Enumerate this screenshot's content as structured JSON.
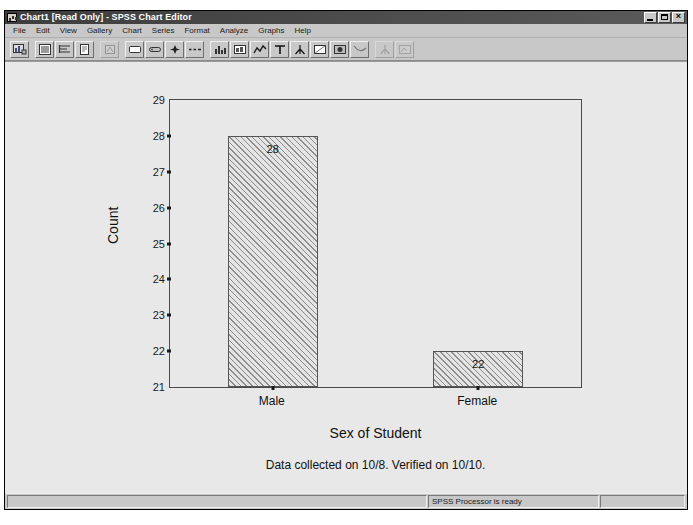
{
  "window": {
    "title": "Chart1 [Read Only] - SPSS Chart Editor",
    "icon": "chart-window-icon",
    "controls": {
      "minimize": "_",
      "maximize": "□",
      "close": "×"
    }
  },
  "menubar": {
    "items": [
      {
        "label": "File"
      },
      {
        "label": "Edit"
      },
      {
        "label": "View"
      },
      {
        "label": "Gallery"
      },
      {
        "label": "Chart"
      },
      {
        "label": "Series"
      },
      {
        "label": "Format"
      },
      {
        "label": "Analyze"
      },
      {
        "label": "Graphs"
      },
      {
        "label": "Help"
      }
    ]
  },
  "toolbar": {
    "buttons": [
      {
        "icon": "chart-properties-icon",
        "enabled": true
      },
      {
        "icon": "fill-pattern-icon",
        "enabled": true
      },
      {
        "icon": "text-alignment-icon",
        "enabled": true
      },
      {
        "icon": "color-palette-icon",
        "enabled": true
      },
      {
        "icon": "spin-chart-icon",
        "enabled": false
      },
      {
        "icon": "bar-style-icon",
        "enabled": true
      },
      {
        "icon": "bar-label-style-icon",
        "enabled": true
      },
      {
        "icon": "marker-icon",
        "enabled": true
      },
      {
        "icon": "line-style-icon",
        "enabled": true
      },
      {
        "icon": "bar-chart-icon",
        "enabled": true
      },
      {
        "icon": "histogram-icon",
        "enabled": true
      },
      {
        "icon": "line-chart-icon",
        "enabled": true
      },
      {
        "icon": "text-tool-icon",
        "enabled": true
      },
      {
        "icon": "axis-tool-icon",
        "enabled": true
      },
      {
        "icon": "outer-frame-icon",
        "enabled": true
      },
      {
        "icon": "inner-frame-icon",
        "enabled": true
      },
      {
        "icon": "reference-line-icon",
        "enabled": true
      },
      {
        "icon": "explode-slice-icon",
        "enabled": false
      },
      {
        "icon": "swap-axes-icon",
        "enabled": false
      }
    ]
  },
  "statusbar": {
    "left": "",
    "message": "SPSS Processor is ready",
    "right": ""
  },
  "chart_data": {
    "type": "bar",
    "categories": [
      "Male",
      "Female"
    ],
    "values": [
      28,
      22
    ],
    "bar_labels": [
      "28",
      "22"
    ],
    "title": "",
    "xlabel": "Sex of Student",
    "ylabel": "Count",
    "ylim": [
      21,
      29
    ],
    "yticks": [
      21,
      22,
      23,
      24,
      25,
      26,
      27,
      28,
      29
    ],
    "ytick_labels": [
      "21",
      "22",
      "23",
      "24",
      "25",
      "26",
      "27",
      "28",
      "29"
    ],
    "grid": false,
    "legend": null,
    "footnote": "Data collected on 10/8. Verified on 10/10.",
    "bar_fill": "diagonal-hatch",
    "bar_border_color": "#555555",
    "background": "#e8e8e8"
  }
}
